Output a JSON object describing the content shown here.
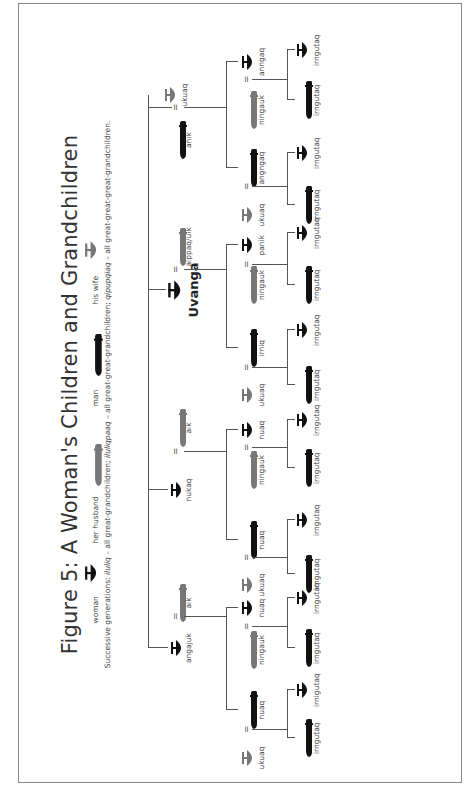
{
  "figure": {
    "title": "Figure 5: A Woman's Children and Grandchildren",
    "legend": {
      "woman": "woman",
      "her_husband": "her husband",
      "man": "man",
      "his_wife": "his wife"
    },
    "subtitle": {
      "prefix": "Successive generations: ",
      "t1": "iluliq",
      "d1": " – all great-grandchildren; ",
      "t2": "iluliqpaaq",
      "d2": " – all great-great-grandchildren; ",
      "t3": "qipupqiaq",
      "d3": " – all great-great-great-grandchildren."
    },
    "colors": {
      "line": "#555555",
      "blood": "#111111",
      "inlaw": "#777777"
    },
    "root": {
      "name": "Uvanga",
      "icon": "woman-icon"
    },
    "generation1": [
      {
        "name": "angajuk",
        "icon": "woman-icon",
        "spouse": "aik",
        "spouse_icon": "her-husband-icon"
      },
      {
        "name": "nukaq",
        "icon": "woman-icon",
        "spouse": "aik",
        "spouse_icon": "her-husband-icon"
      },
      {
        "name": "aippaq/uik",
        "icon": "her-husband-icon"
      },
      {
        "name": "anik",
        "icon": "man-icon",
        "spouse": "ukuaq",
        "spouse_icon": "his-wife-icon"
      }
    ],
    "generation2": [
      {
        "name": "nuaq",
        "icon": "man-icon",
        "spouse": "ukuaq",
        "spouse_icon": "his-wife-icon",
        "children": [
          "irngutaq",
          "irnigutaq"
        ]
      },
      {
        "name": "nuaq",
        "icon": "woman-icon",
        "spouse": "ningauk",
        "spouse_icon": "her-husband-icon",
        "children": [
          "irngutaq",
          "irngutaq"
        ]
      },
      {
        "name": "nuaq",
        "icon": "man-icon",
        "spouse": "ukuaq",
        "spouse_icon": "his-wife-icon",
        "children": [
          "irngutaq",
          "irngutaq"
        ]
      },
      {
        "name": "nuaq",
        "icon": "woman-icon",
        "spouse": "ningauk",
        "spouse_icon": "her-husband-icon",
        "children": [
          "irngutaq",
          "irngutaq"
        ]
      },
      {
        "name": "irniq",
        "icon": "man-icon",
        "spouse": "ukuaq",
        "spouse_icon": "his-wife-icon",
        "children": [
          "irngutaq",
          "irngutaq"
        ]
      },
      {
        "name": "panik",
        "icon": "woman-icon",
        "spouse": "ningauk",
        "spouse_icon": "her-husband-icon",
        "children": [
          "irngutaq",
          "irngutaq"
        ]
      },
      {
        "name": "angngaq",
        "icon": "man-icon",
        "spouse": "ukuaq",
        "spouse_icon": "his-wife-icon",
        "children": [
          "irngutaq",
          "irngutaq"
        ]
      },
      {
        "name": "anngaq",
        "icon": "woman-icon",
        "spouse": "ningauk",
        "spouse_icon": "her-husband-icon",
        "children": [
          "irngutaq",
          "irngutaq"
        ]
      }
    ]
  }
}
